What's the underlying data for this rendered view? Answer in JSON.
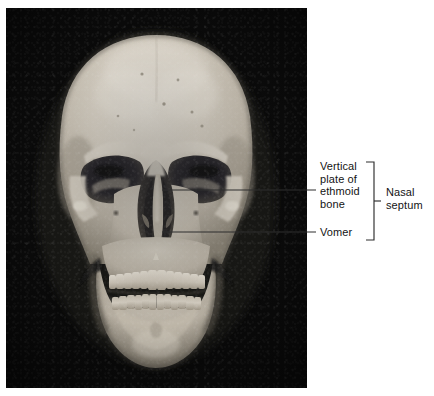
{
  "figure": {
    "type": "anatomical-photograph-with-labels",
    "background_color": "#ffffff",
    "photo_background_color": "#0a0a0a",
    "bone_color": "#d8d2c6",
    "line_color": "#3c3c3c"
  },
  "labels": {
    "ethmoid": {
      "text": "Vertical\nplate of\nethmoid\nbone",
      "lines": [
        "Vertical",
        "plate of",
        "ethmoid",
        "bone"
      ]
    },
    "vomer": {
      "text": "Vomer",
      "lines": [
        "Vomer"
      ]
    },
    "nasal_septum": {
      "text": "Nasal\nseptum",
      "lines": [
        "Nasal",
        "septum"
      ]
    }
  },
  "leader_lines": [
    {
      "name": "ethmoid-leader",
      "from": [
        162,
        190
      ],
      "to": [
        316,
        190
      ],
      "points_to": "vertical plate of ethmoid bone"
    },
    {
      "name": "vomer-leader",
      "from": [
        162,
        232
      ],
      "to": [
        316,
        232
      ],
      "points_to": "vomer"
    }
  ],
  "bracket": {
    "name": "nasal-septum-bracket",
    "x": 374,
    "top": 162,
    "bottom": 240,
    "arm_length": 8,
    "tick_y": 201,
    "tick_length": 7,
    "groups": [
      "Vertical plate of ethmoid bone",
      "Vomer"
    ],
    "label": "Nasal septum"
  },
  "photo_region": {
    "x": 6,
    "y": 8,
    "width": 301,
    "height": 380
  }
}
